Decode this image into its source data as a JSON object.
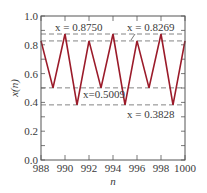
{
  "chart_data": {
    "type": "line",
    "title": "",
    "xlabel": "n",
    "ylabel": "x(n)",
    "xlim": [
      988,
      1000
    ],
    "ylim": [
      0.0,
      1.0
    ],
    "grid": false,
    "x": [
      988,
      989,
      990,
      991,
      992,
      993,
      994,
      995,
      996,
      997,
      998,
      999,
      1000
    ],
    "series": [
      {
        "name": "x(n)",
        "color": "#9b1b2a",
        "values": [
          0.8269,
          0.5009,
          0.875,
          0.3828,
          0.8269,
          0.5009,
          0.875,
          0.3828,
          0.8269,
          0.5009,
          0.875,
          0.3828,
          0.8269
        ]
      }
    ],
    "xticks": [
      988,
      990,
      992,
      994,
      996,
      998,
      1000
    ],
    "xtick_labels": [
      "988",
      "990",
      "992",
      "994",
      "996",
      "998",
      "1000"
    ],
    "yticks": [
      0.0,
      0.2,
      0.4,
      0.6,
      0.8,
      1.0
    ],
    "ytick_labels": [
      "0.0",
      "0.2",
      "0.4",
      "0.6",
      "0.8",
      "1.0"
    ],
    "reference_lines": [
      {
        "y": 0.875,
        "style": "dashed"
      },
      {
        "y": 0.8269,
        "style": "dashed"
      },
      {
        "y": 0.5009,
        "style": "dashed"
      },
      {
        "y": 0.3828,
        "style": "dashed"
      }
    ],
    "annotations": [
      {
        "text": "x = 0.8750",
        "value": 0.875
      },
      {
        "text": "x = 0.8269",
        "value": 0.8269
      },
      {
        "text": "x=0.5009",
        "value": 0.5009
      },
      {
        "text": "x = 0.3828",
        "value": 0.3828
      }
    ],
    "legend": null
  }
}
